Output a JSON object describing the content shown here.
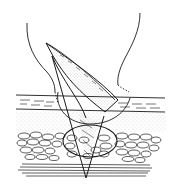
{
  "figure": {
    "type": "line-art-illustration",
    "colors": {
      "background": "#ffffff",
      "ink": "#1a1a1a",
      "stipple": "#555555"
    },
    "layers": [
      {
        "name": "epidermis",
        "pattern": "dashed"
      },
      {
        "name": "dermis",
        "pattern": "stippled"
      },
      {
        "name": "subcutaneous-fat",
        "pattern": "cobblestone"
      },
      {
        "name": "fascia",
        "pattern": "horizontal-lines"
      }
    ],
    "elements": [
      "outer-contour-left",
      "outer-contour-right",
      "flap-blade",
      "flap-inner-band",
      "incision-circle-upper",
      "incision-ellipse-lower"
    ]
  }
}
